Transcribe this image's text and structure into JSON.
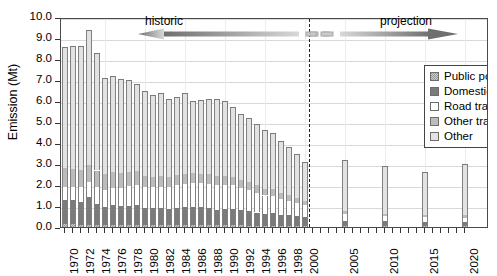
{
  "axes": {
    "ylabel": "Emission (Mt)",
    "yticks": [
      "0.0",
      "1.0",
      "2.0",
      "3.0",
      "4.0",
      "5.0",
      "6.0",
      "7.0",
      "8.0",
      "9.0",
      "10.0"
    ],
    "xlabels": [
      "1970",
      "1972",
      "1974",
      "1976",
      "1978",
      "1980",
      "1982",
      "1984",
      "1986",
      "1988",
      "1990",
      "1992",
      "1994",
      "1996",
      "1998",
      "2000",
      "2005",
      "2010",
      "2015",
      "2020"
    ]
  },
  "annotations": {
    "historic": "historic",
    "projection": "projection"
  },
  "legend": {
    "items": [
      {
        "label": "Public power",
        "swatch": "checker-gray",
        "color": "#9a9a9a"
      },
      {
        "label": "Domestic",
        "swatch": "solid-dark-gray",
        "color": "#7b7b7b"
      },
      {
        "label": "Road transport",
        "swatch": "white",
        "color": "#ffffff"
      },
      {
        "label": "Other transport",
        "swatch": "mid-gray",
        "color": "#bcbcbc"
      },
      {
        "label": "Other",
        "swatch": "light-gray",
        "color": "#e2e2e2"
      }
    ]
  },
  "chart_data": {
    "type": "bar",
    "title": "",
    "xlabel": "",
    "ylabel": "Emission (Mt)",
    "ylim": [
      0.0,
      10.0
    ],
    "ytick_step": 1.0,
    "grid": true,
    "stacked": true,
    "legend_position": "top-right-inside",
    "divider_year": 2000,
    "annotations": [
      {
        "text": "historic",
        "span": [
          1970,
          2000
        ],
        "arrow": "left"
      },
      {
        "text": "projection",
        "span": [
          2000,
          2020
        ],
        "arrow": "right"
      }
    ],
    "categories": [
      1970,
      1971,
      1972,
      1973,
      1974,
      1975,
      1976,
      1977,
      1978,
      1979,
      1980,
      1981,
      1982,
      1983,
      1984,
      1985,
      1986,
      1987,
      1988,
      1989,
      1990,
      1991,
      1992,
      1993,
      1994,
      1995,
      1996,
      1997,
      1998,
      1999,
      2000,
      2005,
      2010,
      2015,
      2020
    ],
    "series": [
      {
        "name": "Public power",
        "color": "#9a9a9a",
        "values": [
          0.12,
          0.12,
          0.11,
          0.11,
          0.11,
          0.1,
          0.1,
          0.1,
          0.1,
          0.1,
          0.09,
          0.09,
          0.09,
          0.09,
          0.09,
          0.09,
          0.09,
          0.09,
          0.09,
          0.08,
          0.08,
          0.08,
          0.08,
          0.07,
          0.07,
          0.07,
          0.07,
          0.06,
          0.06,
          0.06,
          0.06,
          0.05,
          0.05,
          0.05,
          0.05
        ]
      },
      {
        "name": "Domestic",
        "color": "#7b7b7b",
        "values": [
          1.18,
          1.18,
          1.1,
          1.3,
          1.0,
          0.85,
          0.93,
          0.9,
          0.92,
          0.95,
          0.83,
          0.8,
          0.8,
          0.78,
          0.82,
          0.88,
          0.88,
          0.85,
          0.8,
          0.72,
          0.78,
          0.8,
          0.72,
          0.7,
          0.62,
          0.55,
          0.6,
          0.5,
          0.5,
          0.46,
          0.42,
          0.25,
          0.22,
          0.2,
          0.2
        ]
      },
      {
        "name": "Road transport",
        "color": "#ffffff",
        "values": [
          0.62,
          0.62,
          0.68,
          0.72,
          0.78,
          0.82,
          0.85,
          0.88,
          0.92,
          0.95,
          0.98,
          1.0,
          1.02,
          1.05,
          1.08,
          1.1,
          1.12,
          1.15,
          1.18,
          1.2,
          1.15,
          1.1,
          1.05,
          1.0,
          0.95,
          0.88,
          0.82,
          0.76,
          0.7,
          0.62,
          0.55,
          0.3,
          0.25,
          0.22,
          0.2
        ]
      },
      {
        "name": "Other transport",
        "color": "#bcbcbc",
        "values": [
          0.88,
          0.85,
          0.82,
          0.8,
          0.8,
          0.75,
          0.72,
          0.7,
          0.7,
          0.68,
          0.52,
          0.5,
          0.5,
          0.48,
          0.48,
          0.47,
          0.46,
          0.45,
          0.45,
          0.44,
          0.42,
          0.4,
          0.38,
          0.36,
          0.34,
          0.32,
          0.3,
          0.28,
          0.26,
          0.24,
          0.22,
          0.15,
          0.12,
          0.12,
          0.12
        ]
      },
      {
        "name": "Other",
        "color": "#e2e2e2",
        "values": [
          5.75,
          5.83,
          5.89,
          6.47,
          5.61,
          4.58,
          4.6,
          4.47,
          4.38,
          4.12,
          4.08,
          3.91,
          3.99,
          3.7,
          3.73,
          3.86,
          3.46,
          3.51,
          3.58,
          3.66,
          3.57,
          3.32,
          3.17,
          3.07,
          2.92,
          2.78,
          2.71,
          2.5,
          2.28,
          2.12,
          1.85,
          2.45,
          2.26,
          2.01,
          2.43
        ]
      }
    ],
    "totals": [
      8.55,
      8.6,
      8.6,
      8.8,
      8.3,
      7.1,
      7.2,
      7.05,
      7.02,
      6.8,
      6.5,
      6.3,
      6.4,
      6.1,
      6.2,
      6.4,
      6.01,
      6.05,
      6.1,
      6.1,
      6.0,
      5.7,
      5.4,
      5.2,
      4.9,
      4.6,
      4.5,
      4.1,
      3.8,
      3.5,
      3.1,
      3.2,
      2.9,
      2.6,
      3.0
    ]
  }
}
